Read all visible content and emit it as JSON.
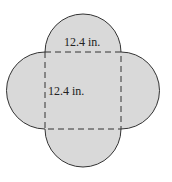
{
  "figure": {
    "type": "square with four semicircles on each side (quatrefoil)",
    "square_side_label": "12.4 in.",
    "square_height_label": "12.4 in.",
    "fill_color": "#d9d9d9",
    "stroke_color": "#333333"
  }
}
